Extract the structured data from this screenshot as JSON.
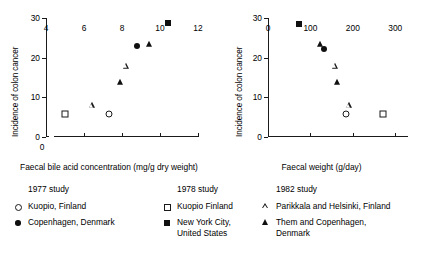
{
  "chart_data": [
    {
      "type": "scatter",
      "title": "",
      "xlabel": "Faecal bile acid concentration (mg/g dry weight)",
      "ylabel": "Incidence of colon cancer",
      "xlim": [
        4,
        12
      ],
      "ylim": [
        0,
        30
      ],
      "xticks": [
        4,
        6,
        8,
        10,
        12
      ],
      "yticks": [
        0,
        10,
        20,
        30
      ],
      "axis_break_origin_label": "0",
      "grid": false,
      "legend_position": "below",
      "points": [
        {
          "series": "Kuopio, Finland (1977 study)",
          "marker": "circle-open",
          "x": 7.3,
          "y": 5.8
        },
        {
          "series": "Copenhagen, Denmark (1977 study)",
          "marker": "circle-filled",
          "x": 8.8,
          "y": 23.0
        },
        {
          "series": "Kuopio Finland (1978 study)",
          "marker": "square-open",
          "x": 5.0,
          "y": 5.7
        },
        {
          "series": "New York City, United States (1978 study)",
          "marker": "square-filled",
          "x": 10.4,
          "y": 28.7
        },
        {
          "series": "Parikkala and Helsinki, Finland (1982 study)",
          "marker": "triangle-open",
          "x": 6.4,
          "y": 8.0
        },
        {
          "series": "Parikkala and Helsinki, Finland (1982 study)",
          "marker": "triangle-open",
          "x": 8.2,
          "y": 18.0
        },
        {
          "series": "Them and Copenhagen, Denmark (1982 study)",
          "marker": "triangle-filled",
          "x": 7.9,
          "y": 13.8
        },
        {
          "series": "Them and Copenhagen, Denmark (1982 study)",
          "marker": "triangle-filled",
          "x": 9.4,
          "y": 23.4
        }
      ]
    },
    {
      "type": "scatter",
      "title": "",
      "xlabel": "Faecal weight (g/day)",
      "ylabel": "Incidence of colon cancer",
      "xlim": [
        0,
        330
      ],
      "ylim": [
        0,
        30
      ],
      "xticks": [
        0,
        100,
        200,
        300
      ],
      "yticks": [
        0,
        10,
        20,
        30
      ],
      "grid": false,
      "legend_position": "below",
      "points": [
        {
          "series": "Kuopio, Finland (1977 study)",
          "marker": "circle-open",
          "x": 185,
          "y": 5.8
        },
        {
          "series": "Copenhagen, Denmark (1977 study)",
          "marker": "circle-filled",
          "x": 133,
          "y": 22.3
        },
        {
          "series": "Kuopio Finland (1978 study)",
          "marker": "square-open",
          "x": 270,
          "y": 5.7
        },
        {
          "series": "New York City, United States (1978 study)",
          "marker": "square-filled",
          "x": 72,
          "y": 28.5
        },
        {
          "series": "Parikkala and Helsinki, Finland (1982 study)",
          "marker": "triangle-open",
          "x": 157,
          "y": 18.0
        },
        {
          "series": "Parikkala and Helsinki, Finland (1982 study)",
          "marker": "triangle-open",
          "x": 190,
          "y": 8.0
        },
        {
          "series": "Them and Copenhagen, Denmark (1982 study)",
          "marker": "triangle-filled",
          "x": 122,
          "y": 23.5
        },
        {
          "series": "Them and Copenhagen, Denmark (1982 study)",
          "marker": "triangle-filled",
          "x": 163,
          "y": 13.8
        }
      ]
    }
  ],
  "left_chart": {
    "ylabel": "Incidence of colon cancer",
    "xlabel": "Faecal bile acid concentration (mg/g dry weight)",
    "ytick_labels": [
      "0",
      "10",
      "20",
      "30"
    ],
    "xtick_labels": [
      "4",
      "6",
      "8",
      "10",
      "12"
    ],
    "origin_label": "0"
  },
  "right_chart": {
    "ylabel": "Incidence of colon cancer",
    "xlabel": "Faecal weight (g/day)",
    "ytick_labels": [
      "0",
      "10",
      "20",
      "30"
    ],
    "xtick_labels": [
      "0",
      "100",
      "200",
      "300"
    ],
    "origin_label": "0"
  },
  "legend": {
    "columns": [
      {
        "heading": "1977 study",
        "items": [
          {
            "marker": "circle-open",
            "label": "Kuopio, Finland",
            "label2": ""
          },
          {
            "marker": "circle-filled",
            "label": "Copenhagen, Denmark",
            "label2": ""
          }
        ]
      },
      {
        "heading": "1978 study",
        "items": [
          {
            "marker": "square-open",
            "label": "Kuopio Finland",
            "label2": ""
          },
          {
            "marker": "square-filled",
            "label": "New York City,",
            "label2": "United States"
          }
        ]
      },
      {
        "heading": "1982 study",
        "items": [
          {
            "marker": "triangle-open",
            "label": "Parikkala and Helsinki, Finland",
            "label2": ""
          },
          {
            "marker": "triangle-filled",
            "label": "Them and Copenhagen,",
            "label2": "Denmark"
          }
        ]
      }
    ]
  },
  "colors": {
    "ink": "#1a1a1a",
    "marker_fill": "#101010",
    "background": "#ffffff"
  }
}
